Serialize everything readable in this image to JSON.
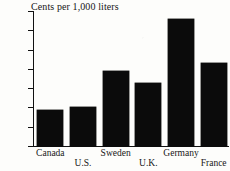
{
  "chart_data": {
    "type": "bar",
    "title": "Cents per 1,000 liters",
    "xlabel": "",
    "ylabel": "",
    "categories": [
      "Canada",
      "U.S.",
      "Sweden",
      "U.K.",
      "Germany",
      "France"
    ],
    "values": [
      37,
      40,
      78,
      65,
      132,
      86
    ],
    "ylim": [
      0,
      140
    ],
    "yticks": [
      0,
      20,
      40,
      60,
      80,
      100,
      120,
      140
    ],
    "ytick_labels": [
      "0",
      "20",
      "40",
      "60",
      "80",
      "100",
      "120",
      "140¢"
    ],
    "grid": false,
    "legend": false,
    "bar_color": "#0b0b0b",
    "axis_color": "#111111",
    "label_stagger": [
      "top",
      "bottom",
      "top",
      "bottom",
      "top",
      "bottom"
    ]
  }
}
